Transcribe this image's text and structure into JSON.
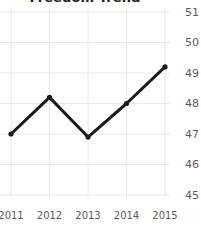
{
  "chart_data": {
    "type": "line",
    "title": "Freedom Trend",
    "xlabel": "",
    "ylabel": "",
    "categories": [
      "2011",
      "2012",
      "2013",
      "2014",
      "2015"
    ],
    "x": [
      2011,
      2012,
      2013,
      2014,
      2015
    ],
    "values": [
      47.0,
      48.2,
      46.9,
      48.0,
      49.2
    ],
    "series": [
      {
        "name": "Freedom Trend",
        "values": [
          47.0,
          48.2,
          46.9,
          48.0,
          49.2
        ]
      }
    ],
    "ylim": [
      45,
      51
    ],
    "xlim": [
      2011,
      2015
    ],
    "yticks": [
      51,
      50,
      49,
      48,
      47,
      46,
      45
    ],
    "xticks": [
      "2011",
      "2012",
      "2013",
      "2014",
      "2015"
    ],
    "ytick_labels": [
      "51",
      "50",
      "49",
      "48",
      "47",
      "46",
      "45"
    ],
    "xtick_labels": [
      "2011",
      "2012",
      "2013",
      "2014",
      "2015"
    ],
    "grid": true,
    "grid_axis": "both",
    "legend": false,
    "legend_position": "none",
    "y_axis_side": "right",
    "markers": true,
    "marker_shape": "circle",
    "colors": {
      "line": "#1a1a1a",
      "marker": "#1a1a1a",
      "grid": "#e8e8e8",
      "background": "#ffffff",
      "tick_label": "#5a5a5a",
      "title": "#1c1c1c"
    },
    "line_width": 3
  }
}
